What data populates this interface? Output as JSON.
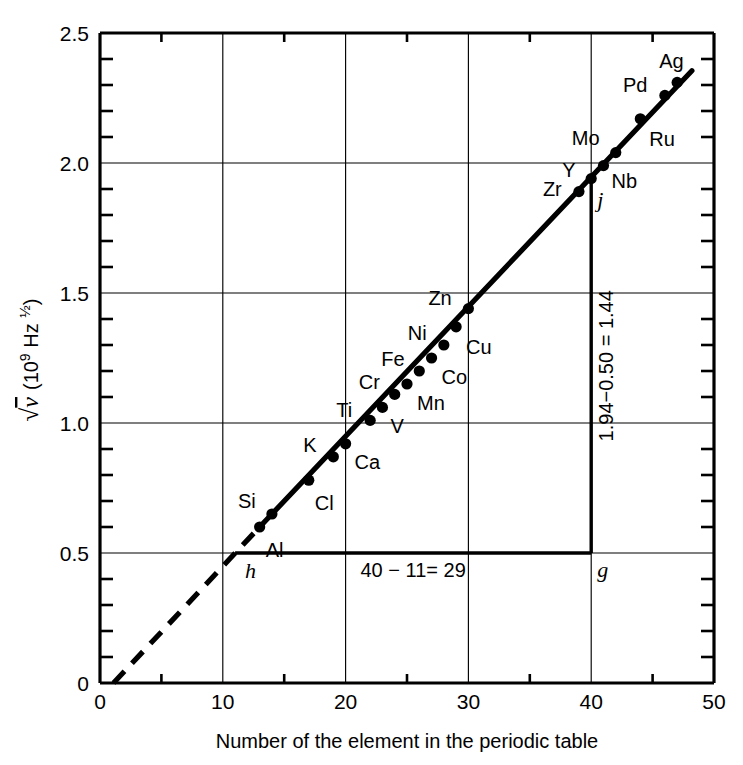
{
  "chart_data": {
    "type": "scatter",
    "title": "",
    "xlabel": "Number of the element in the periodic table",
    "ylabel": "√ν  (10⁹ Hz ½)",
    "ylabel_parts": {
      "radical": "√",
      "nu": "ν",
      "units": "(10",
      "exponent": "9",
      "units_tail": " Hz ",
      "half": "½",
      "close": ")"
    },
    "xlim": [
      0,
      50
    ],
    "ylim": [
      0,
      2.5
    ],
    "x_ticks": [
      0,
      10,
      20,
      30,
      40,
      50
    ],
    "x_ticklabels": [
      "0",
      "10",
      "20",
      "30",
      "40",
      "50"
    ],
    "x_minor_step": 5,
    "y_ticks": [
      0,
      0.5,
      1.0,
      1.5,
      2.0,
      2.5
    ],
    "y_ticklabels": [
      "0",
      "0.5",
      "1.0",
      "1.5",
      "2.0",
      "2.5"
    ],
    "y_minor_step": 0.1,
    "grid": "major gridlines at x=10,20,30,40 and y=0.5,1.0,1.5,2.0",
    "legend": "none",
    "points": [
      {
        "label": "Al",
        "x": 13,
        "y": 0.6,
        "label_dx": 6,
        "label_dy": 30
      },
      {
        "label": "Si",
        "x": 14,
        "y": 0.65,
        "label_dx": -34,
        "label_dy": -6
      },
      {
        "label": "Cl",
        "x": 17,
        "y": 0.78,
        "label_dx": 6,
        "label_dy": 30
      },
      {
        "label": "K",
        "x": 19,
        "y": 0.87,
        "label_dx": -30,
        "label_dy": -5
      },
      {
        "label": "Ca",
        "x": 20,
        "y": 0.92,
        "label_dx": 9,
        "label_dy": 25
      },
      {
        "label": "Ti",
        "x": 22,
        "y": 1.01,
        "label_dx": -34,
        "label_dy": -3
      },
      {
        "label": "V",
        "x": 23,
        "y": 1.06,
        "label_dx": 8,
        "label_dy": 26
      },
      {
        "label": "Cr",
        "x": 24,
        "y": 1.11,
        "label_dx": -36,
        "label_dy": -5
      },
      {
        "label": "Mn",
        "x": 25,
        "y": 1.15,
        "label_dx": 10,
        "label_dy": 26
      },
      {
        "label": "Fe",
        "x": 26,
        "y": 1.2,
        "label_dx": -38,
        "label_dy": -5
      },
      {
        "label": "Co",
        "x": 27,
        "y": 1.25,
        "label_dx": 10,
        "label_dy": 26
      },
      {
        "label": "Ni",
        "x": 28,
        "y": 1.3,
        "label_dx": -36,
        "label_dy": -5
      },
      {
        "label": "Cu",
        "x": 29,
        "y": 1.37,
        "label_dx": 10,
        "label_dy": 27
      },
      {
        "label": "Zn",
        "x": 30,
        "y": 1.44,
        "label_dx": -40,
        "label_dy": -4
      },
      {
        "label": "Zr",
        "x": 39,
        "y": 1.89,
        "label_dx": -36,
        "label_dy": 4
      },
      {
        "label": "Y",
        "x": 40,
        "y": 1.94,
        "label_dx": -29,
        "label_dy": -2
      },
      {
        "label": "Nb",
        "x": 41,
        "y": 1.99,
        "label_dx": 8,
        "label_dy": 22
      },
      {
        "label": "Mo",
        "x": 42,
        "y": 2.04,
        "label_dx": -44,
        "label_dy": -8
      },
      {
        "label": "Ru",
        "x": 44,
        "y": 2.17,
        "label_dx": 9,
        "label_dy": 27
      },
      {
        "label": "Pd",
        "x": 46,
        "y": 2.26,
        "label_dx": -42,
        "label_dy": -3
      },
      {
        "label": "Ag",
        "x": 47,
        "y": 2.31,
        "label_dx": -18,
        "label_dy": -14
      }
    ],
    "fit_line": {
      "solid": {
        "x0": 13,
        "y0": 0.6,
        "x1": 48.2,
        "y1": 2.355
      },
      "dashed": {
        "x0": 1.1,
        "y0": 0.0,
        "x1": 13,
        "y1": 0.6
      },
      "description": "straight line through the data points, extrapolated with a dashed segment toward the origin"
    },
    "construction_triangle": {
      "description": "slope construction triangle used to read the gradient",
      "vertices": [
        {
          "name": "h",
          "x": 11,
          "y": 0.5
        },
        {
          "name": "g",
          "x": 40,
          "y": 0.5
        },
        {
          "name": "j",
          "x": 40,
          "y": 1.94
        }
      ],
      "horizontal_annotation": "40 − 11= 29",
      "vertical_annotation": "1.94−0.50 = 1.44",
      "slope": 0.0497
    },
    "vertex_labels": {
      "h": "h",
      "g": "g",
      "j": "j"
    }
  },
  "figure": {
    "background_color": "#ffffff",
    "ink_color": "#000000"
  }
}
